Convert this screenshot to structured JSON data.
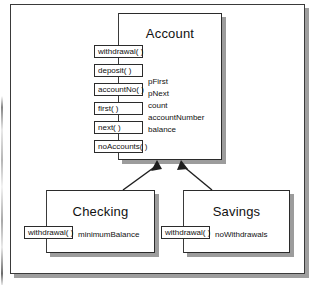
{
  "diagram": {
    "type": "uml-class-diagram",
    "notation": "booch-style-operation-boxes",
    "colors": {
      "box_fill": "#ffffff",
      "box_border": "#2b2b2b",
      "shadow": "#9c9c9c",
      "frame_border": "#3a3a3a",
      "text": "#111111"
    },
    "classes": [
      {
        "id": "account",
        "name": "Account",
        "operations": [
          "withdrawal( )",
          "deposit( )",
          "accountNo( )",
          "first( )",
          "next( )",
          "noAccounts( )"
        ],
        "attributes": [
          "pFirst",
          "pNext",
          "count",
          "accountNumber",
          "balance"
        ]
      },
      {
        "id": "checking",
        "name": "Checking",
        "operations": [
          "withdrawal( )"
        ],
        "attributes": [
          "minimumBalance"
        ]
      },
      {
        "id": "savings",
        "name": "Savings",
        "operations": [
          "withdrawal( )"
        ],
        "attributes": [
          "noWithdrawals"
        ]
      }
    ],
    "relationships": [
      {
        "kind": "inheritance",
        "from": "checking",
        "to": "account"
      },
      {
        "kind": "inheritance",
        "from": "savings",
        "to": "account"
      }
    ]
  }
}
